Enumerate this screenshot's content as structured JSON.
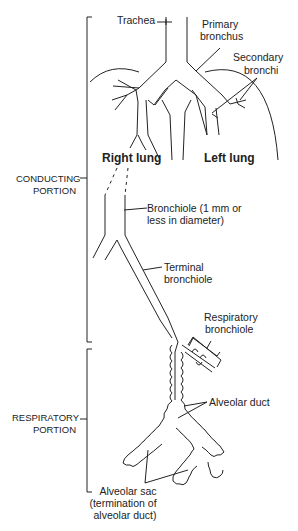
{
  "diagram": {
    "labels": {
      "trachea": "Trachea",
      "primary_bronchus_1": "Primary",
      "primary_bronchus_2": "bronchus",
      "secondary_bronchi_1": "Secondary",
      "secondary_bronchi_2": "bronchi",
      "right_lung": "Right lung",
      "left_lung": "Left lung",
      "bronchiole_1": "Bronchiole (1 mm or",
      "bronchiole_2": "less in diameter)",
      "terminal_bronchiole_1": "Terminal",
      "terminal_bronchiole_2": "bronchiole",
      "respiratory_bronchiole_1": "Respiratory",
      "respiratory_bronchiole_2": "bronchiole",
      "alveolar_duct": "Alveolar duct",
      "alveolar_sac_1": "Alveolar sac",
      "alveolar_sac_2": "(termination of",
      "alveolar_sac_3": "alveolar duct)"
    },
    "sections": {
      "conducting_1": "CONDUCTING",
      "conducting_2": "PORTION",
      "respiratory_1": "RESPIRATORY",
      "respiratory_2": "PORTION"
    },
    "colors": {
      "line": "#222222",
      "background": "#ffffff"
    }
  }
}
